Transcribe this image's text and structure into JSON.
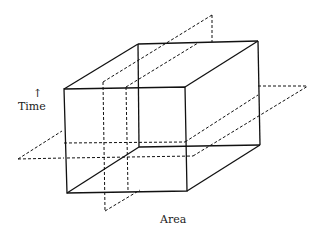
{
  "labels": {
    "time": "Time",
    "time_arrow": "↑",
    "area": "Area"
  },
  "colors": {
    "line": "#111111",
    "background": "#ffffff"
  }
}
